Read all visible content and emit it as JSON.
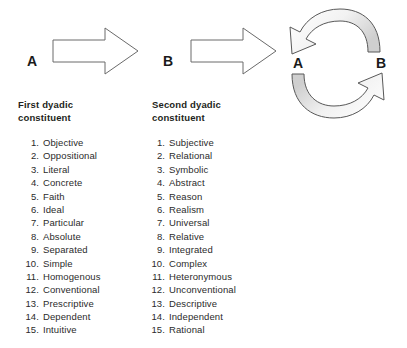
{
  "diagram": {
    "flow": {
      "start_label": "A",
      "middle_label": "B",
      "arrow1_icon": "right-block-arrow-icon",
      "arrow2_icon": "right-block-arrow-icon"
    },
    "cycle": {
      "left_label": "A",
      "right_label": "B",
      "top_arc_icon": "curved-arrow-b-to-a-icon",
      "bottom_arc_icon": "curved-arrow-a-to-b-icon",
      "arc_fill": "#e0e0e0",
      "arc_stroke": "#4d4d4d"
    },
    "stroke_color": "#555555",
    "text_color": "#231f20"
  },
  "columns": [
    {
      "heading": "First dyadic constituent",
      "items": [
        "Objective",
        "Oppositional",
        "Literal",
        "Concrete",
        "Faith",
        "Ideal",
        "Particular",
        "Absolute",
        "Separated",
        "Simple",
        "Homogenous",
        "Conventional",
        "Prescriptive",
        "Dependent",
        "Intuitive"
      ]
    },
    {
      "heading": "Second dyadic constituent",
      "items": [
        "Subjective",
        "Relational",
        "Symbolic",
        "Abstract",
        "Reason",
        "Realism",
        "Universal",
        "Relative",
        "Integrated",
        "Complex",
        "Heteronymous",
        "Unconventional",
        "Descriptive",
        "Independent",
        "Rational"
      ]
    }
  ]
}
